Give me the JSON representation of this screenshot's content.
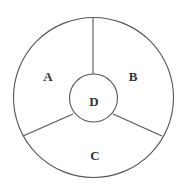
{
  "diagram": {
    "type": "segmented-circle",
    "outer_circle": {
      "cx": 93.5,
      "cy": 97.5,
      "r": 80
    },
    "inner_circle": {
      "cx": 93.5,
      "cy": 98,
      "r": 24
    },
    "stroke_color": "#555555",
    "regions": [
      {
        "id": "A",
        "label": "A",
        "x": 48,
        "y": 81
      },
      {
        "id": "B",
        "label": "B",
        "x": 133,
        "y": 81
      },
      {
        "id": "C",
        "label": "C",
        "x": 95,
        "y": 160
      },
      {
        "id": "D",
        "label": "D",
        "x": 94,
        "y": 106
      }
    ]
  }
}
